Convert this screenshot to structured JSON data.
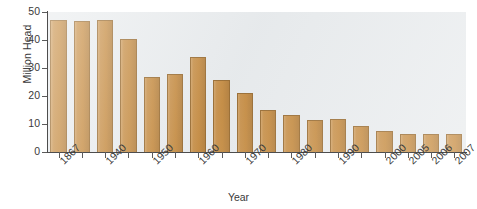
{
  "chart_data": {
    "type": "bar",
    "title": "",
    "xlabel": "Year",
    "ylabel": "Million Head",
    "ylim": [
      0,
      50
    ],
    "yticks": [
      0,
      10,
      20,
      30,
      40,
      50
    ],
    "grid": false,
    "legend": "none",
    "bar_color": "#c07f2c",
    "bar_edge_color": "#8d5a18",
    "plot_background": "#e7eaec",
    "categories": [
      "1867",
      "",
      "1940",
      "",
      "1950",
      "",
      "1960",
      "",
      "1970",
      "",
      "1980",
      "",
      "1990",
      "",
      "2000",
      "2005",
      "2006",
      "2007"
    ],
    "tick_labels": [
      "1867",
      "1940",
      "1950",
      "1960",
      "1970",
      "1980",
      "1990",
      "2000",
      "2005",
      "2006",
      "2007"
    ],
    "bars": [
      {
        "label": "1867",
        "value": 47.0
      },
      {
        "label": "",
        "value": 46.8
      },
      {
        "label": "1940",
        "value": 47.0
      },
      {
        "label": "",
        "value": 40.5
      },
      {
        "label": "1950",
        "value": 26.8
      },
      {
        "label": "",
        "value": 27.7
      },
      {
        "label": "1960",
        "value": 34.0
      },
      {
        "label": "",
        "value": 25.7
      },
      {
        "label": "1970",
        "value": 21.0
      },
      {
        "label": "",
        "value": 15.0
      },
      {
        "label": "1980",
        "value": 13.2
      },
      {
        "label": "",
        "value": 11.3
      },
      {
        "label": "1990",
        "value": 11.8
      },
      {
        "label": "",
        "value": 9.4
      },
      {
        "label": "2000",
        "value": 7.4
      },
      {
        "label": "2005",
        "value": 6.5
      },
      {
        "label": "2006",
        "value": 6.5
      },
      {
        "label": "2007",
        "value": 6.5
      }
    ],
    "values": [
      47.0,
      46.8,
      47.0,
      40.5,
      26.8,
      27.7,
      34.0,
      25.7,
      21.0,
      15.0,
      13.2,
      11.3,
      11.8,
      9.4,
      7.4,
      6.5,
      6.5,
      6.5
    ]
  }
}
